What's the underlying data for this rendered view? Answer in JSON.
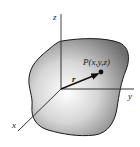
{
  "diagram": {
    "axes": {
      "x_label": "x",
      "y_label": "y",
      "z_label": "z"
    },
    "point_label": "P(x,y,z)",
    "vector_label": "r",
    "colors": {
      "body_dark": "#7a7a7a",
      "body_light": "#ffffff",
      "outline": "#1a1a1a",
      "axis": "#333333"
    }
  }
}
